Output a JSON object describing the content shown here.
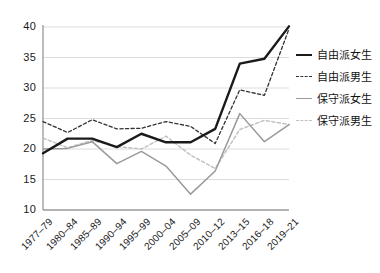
{
  "chart_data": {
    "type": "line",
    "title": "",
    "subtitle": "",
    "xlabel": "",
    "ylabel": "",
    "grid": true,
    "legend_position": "right",
    "ylim": [
      10,
      40
    ],
    "yticks": [
      10,
      15,
      20,
      25,
      30,
      35,
      40
    ],
    "categories": [
      "1977–79",
      "1980–84",
      "1985–89",
      "1990–94",
      "1995–99",
      "2000–04",
      "2005–09",
      "2010–12",
      "2013–15",
      "2016–18",
      "2019–21"
    ],
    "series": [
      {
        "name": "自由派女生",
        "style": "solid",
        "color": "#1a1a1a",
        "width": 2.4,
        "values": [
          19.3,
          21.7,
          21.7,
          20.3,
          22.5,
          21.1,
          21.1,
          23.3,
          34.0,
          34.8,
          40.1
        ]
      },
      {
        "name": "自由派男生",
        "style": "dashed",
        "color": "#333333",
        "width": 1.3,
        "values": [
          24.5,
          22.7,
          24.8,
          23.3,
          23.4,
          24.5,
          23.7,
          20.9,
          29.7,
          28.8,
          39.7
        ]
      },
      {
        "name": "保守派女生",
        "style": "solid",
        "color": "#9a9a9a",
        "width": 1.5,
        "values": [
          20.0,
          20.1,
          21.2,
          17.6,
          19.6,
          17.2,
          12.6,
          16.4,
          25.8,
          21.2,
          24.0
        ]
      },
      {
        "name": "保守派男生",
        "style": "dashed",
        "color": "#c2c2c2",
        "width": 1.5,
        "values": [
          21.8,
          20.2,
          21.4,
          20.4,
          20.0,
          22.1,
          19.0,
          16.8,
          23.2,
          24.7,
          24.0
        ]
      }
    ]
  },
  "legend": {
    "items": [
      {
        "label": "自由派女生"
      },
      {
        "label": "自由派男生"
      },
      {
        "label": "保守派女生"
      },
      {
        "label": "保守派男生"
      }
    ]
  },
  "colors": {
    "axis": "#7a7a7a",
    "grid": "#dcdcdc",
    "text": "#1a1a1a",
    "background": "#ffffff"
  }
}
